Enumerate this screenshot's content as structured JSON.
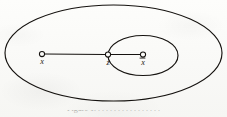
{
  "figure": {
    "kind": "set-diagram",
    "background_color": "#fbfbf9",
    "ink_color": "#15120f",
    "caption_partial": "Figure 1.  . . . . . . . . . . . . . . . .",
    "outer_set": {
      "name": "outer-ellipse",
      "cx": 113.5,
      "cy": 53.0,
      "rx": 108.5,
      "ry": 48.0
    },
    "inner_set": {
      "name": "inner-ellipse",
      "cx": 143.0,
      "cy": 55.5,
      "rx": 35.0,
      "ry": 20.0
    },
    "nodes": [
      {
        "id": "x",
        "label": "x",
        "overbar": false,
        "cx": 42.0,
        "cy": 54.0,
        "r": 2.6,
        "label_x": 42.0,
        "label_y": 64.0
      },
      {
        "id": "z",
        "label": "z",
        "overbar": false,
        "cx": 108.0,
        "cy": 54.5,
        "r": 2.6,
        "label_x": 108.0,
        "label_y": 65.0
      },
      {
        "id": "xbar",
        "label": "x",
        "overbar": true,
        "cx": 143.0,
        "cy": 54.5,
        "r": 2.6,
        "label_x": 143.0,
        "label_y": 65.0
      }
    ],
    "edges": [
      {
        "id": "x-to-z",
        "x1": 44.6,
        "y1": 54.0,
        "x2": 105.4,
        "y2": 54.5
      },
      {
        "id": "z-to-xbar",
        "x1": 110.6,
        "y1": 54.5,
        "x2": 140.4,
        "y2": 54.5
      }
    ]
  }
}
